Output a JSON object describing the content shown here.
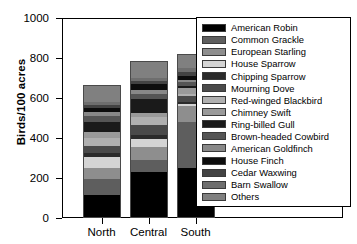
{
  "chart_data": {
    "type": "bar",
    "subtype": "stacked-bar",
    "title": "",
    "xlabel": "",
    "ylabel": "Birds/100 acres",
    "ylim": [
      0,
      1000
    ],
    "yticks": [
      0,
      200,
      400,
      600,
      800,
      1000
    ],
    "ytick_labels": [
      "0",
      "200",
      "400",
      "600",
      "800",
      "1000"
    ],
    "grid": false,
    "legend_position": "right-inside",
    "categories": [
      "North",
      "Central",
      "South"
    ],
    "series": [
      {
        "name": "American Robin",
        "color": "#000000",
        "values": [
          115,
          232,
          250
        ]
      },
      {
        "name": "Common Grackle",
        "color": "#5e5e5e",
        "values": [
          78,
          60,
          232
        ]
      },
      {
        "name": "European Starling",
        "color": "#8e8e8e",
        "values": [
          58,
          62,
          78
        ]
      },
      {
        "name": "House Sparrow",
        "color": "#d4d4d4",
        "values": [
          53,
          42,
          12
        ]
      },
      {
        "name": "Chipping Sparrow",
        "color": "#2b2b2b",
        "values": [
          22,
          18,
          10
        ]
      },
      {
        "name": "Mourning Dove",
        "color": "#4a4a4a",
        "values": [
          36,
          52,
          30
        ]
      },
      {
        "name": "Red-winged Blackbird",
        "color": "#b0b0b0",
        "values": [
          40,
          38,
          8
        ]
      },
      {
        "name": "Chimney Swift",
        "color": "#9a9a9a",
        "values": [
          26,
          22,
          28
        ]
      },
      {
        "name": "Ring-billed Gull",
        "color": "#1a1a1a",
        "values": [
          52,
          70,
          14
        ]
      },
      {
        "name": "Brown-headed Cowbird",
        "color": "#555555",
        "values": [
          30,
          26,
          16
        ]
      },
      {
        "name": "American Goldfinch",
        "color": "#888888",
        "values": [
          20,
          20,
          14
        ]
      },
      {
        "name": "House Finch",
        "color": "#0d0d0d",
        "values": [
          18,
          28,
          18
        ]
      },
      {
        "name": "Cedar Waxwing",
        "color": "#434343",
        "values": [
          16,
          14,
          22
        ]
      },
      {
        "name": "Barn Swallow",
        "color": "#6e6e6e",
        "values": [
          14,
          16,
          16
        ]
      },
      {
        "name": "Others",
        "color": "#808080",
        "values": [
          88,
          83,
          74
        ]
      }
    ],
    "totals": [
      766,
      783,
      822
    ]
  },
  "legend": {
    "entries": [
      {
        "label": "American Robin"
      },
      {
        "label": "Common Grackle"
      },
      {
        "label": "European Starling"
      },
      {
        "label": "House Sparrow"
      },
      {
        "label": "Chipping Sparrow"
      },
      {
        "label": "Mourning Dove"
      },
      {
        "label": "Red-winged Blackbird"
      },
      {
        "label": "Chimney Swift"
      },
      {
        "label": "Ring-billed Gull"
      },
      {
        "label": "Brown-headed Cowbird"
      },
      {
        "label": "American Goldfinch"
      },
      {
        "label": "House Finch"
      },
      {
        "label": "Cedar Waxwing"
      },
      {
        "label": "Barn Swallow"
      },
      {
        "label": "Others"
      }
    ]
  }
}
